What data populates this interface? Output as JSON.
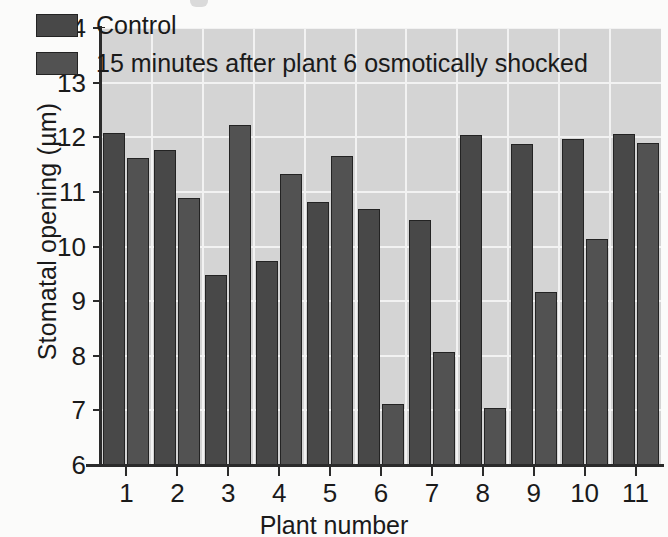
{
  "chart_data": {
    "type": "bar",
    "title": "",
    "xlabel": "Plant number",
    "ylabel": "Stomatal opening (µm)",
    "categories": [
      "1",
      "2",
      "3",
      "4",
      "5",
      "6",
      "7",
      "8",
      "9",
      "10",
      "11"
    ],
    "series": [
      {
        "name": "Control",
        "color": "#484848",
        "values": [
          12.07,
          11.77,
          9.47,
          9.74,
          10.81,
          10.69,
          10.49,
          12.04,
          11.87,
          11.96,
          12.06
        ]
      },
      {
        "name": "15 minutes after plant 6 osmotically shocked",
        "color": "#525252",
        "values": [
          11.62,
          10.88,
          12.22,
          11.33,
          11.65,
          7.12,
          8.06,
          7.05,
          9.16,
          10.13,
          11.89
        ]
      }
    ],
    "ylim": [
      6,
      14
    ],
    "yticks": [
      6,
      7,
      8,
      9,
      10,
      11,
      12,
      13,
      14
    ],
    "ytick_labels": [
      "6",
      "7",
      "8",
      "9",
      "10",
      "11",
      "12",
      "13",
      "14"
    ],
    "grid": true,
    "grid_color": "#f2f2f2",
    "plot_background": "#d4d4d4",
    "legend_position": "top-left"
  },
  "legend": {
    "entries": [
      {
        "label": "Control",
        "color": "#484848"
      },
      {
        "label": "15 minutes after plant 6 osmotically shocked",
        "color": "#525252"
      }
    ]
  },
  "axes": {
    "y_title": "Stomatal opening (µm)",
    "x_title": "Plant number"
  }
}
